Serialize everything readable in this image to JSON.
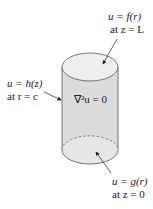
{
  "diagram": {
    "type": "cylinder-boundary-value-problem",
    "colors": {
      "side_fill": "#dcdcdc",
      "top_fill": "#ececec",
      "bottom_fill": "#e4e4e4",
      "stroke": "#555555",
      "text": "#222222"
    },
    "top_label": {
      "line1": "u = f(r)",
      "line2": "at z = L"
    },
    "side_label": {
      "line1": "u = h(z)",
      "line2": "at r = c"
    },
    "center_equation": "∇²u = 0",
    "bottom_label": {
      "line1": "u = g(r)",
      "line2": "at z = 0"
    }
  }
}
